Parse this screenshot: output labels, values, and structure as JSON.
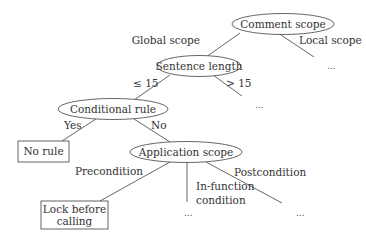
{
  "diagram": {
    "type": "decision-tree",
    "nodes": {
      "root": {
        "label": "Comment scope",
        "shape": "ellipse"
      },
      "sentence_length": {
        "label": "Sentence length",
        "shape": "ellipse"
      },
      "conditional_rule": {
        "label": "Conditional rule",
        "shape": "ellipse"
      },
      "no_rule": {
        "label": "No rule",
        "shape": "box"
      },
      "application_scope": {
        "label": "Application scope",
        "shape": "ellipse"
      },
      "lock_before_calling": {
        "label_line1": "Lock before",
        "label_line2": "calling",
        "shape": "box"
      }
    },
    "edges": {
      "global_scope": "Global scope",
      "local_scope": "Local scope",
      "le15": "≤ 15",
      "gt15": "> 15",
      "yes": "Yes",
      "no": "No",
      "precondition": "Precondition",
      "in_function_line1": "In-function",
      "in_function_line2": "condition",
      "postcondition": "Postcondition"
    },
    "ellipsis": "..."
  }
}
